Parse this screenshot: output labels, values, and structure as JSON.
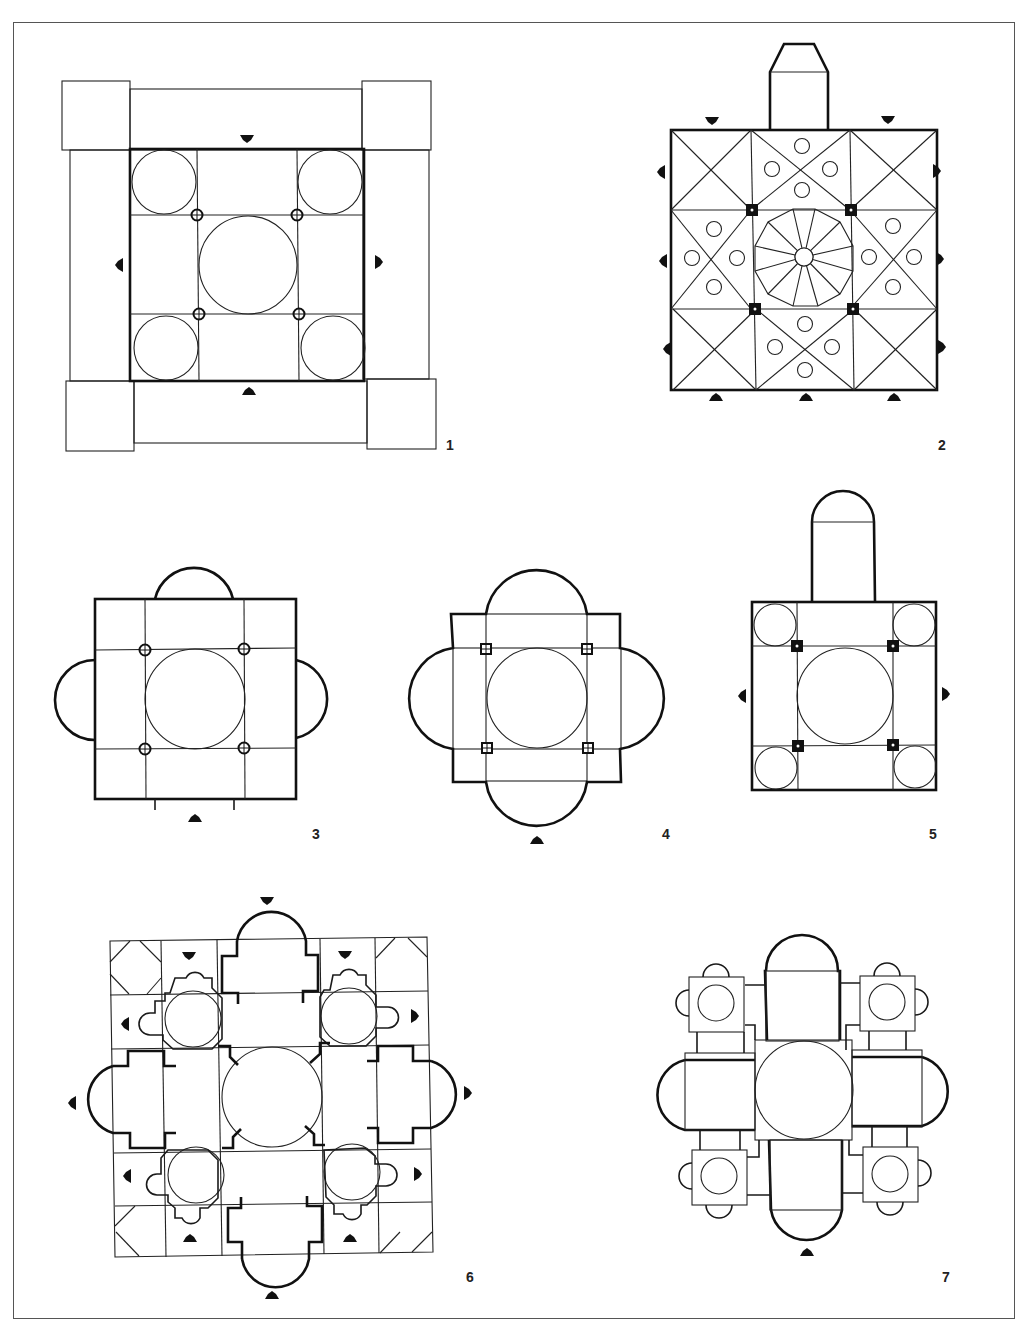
{
  "figure": {
    "type": "architectural floor plans",
    "ink_color": "#111111",
    "background": "#ffffff",
    "plans": [
      {
        "id": "1",
        "label": "1",
        "description": "Square plan with central dome, four corner domes, four piers, surrounding porticoes with corner towers; entrances on four sides"
      },
      {
        "id": "2",
        "label": "2",
        "description": "Square nine-bay plan with cross-vaulted bays, central dodecagonal ribbed dome, polygonal apse at top, four square piers, multiple entrances"
      },
      {
        "id": "3",
        "label": "3",
        "description": "Square plan with central dome, four round piers, semicircular apses on three sides, entrance at bottom"
      },
      {
        "id": "4",
        "label": "4",
        "description": "Quatrefoil / tetraconch plan with central dome, four square piers, four large semicircular apses, entrance at bottom"
      },
      {
        "id": "5",
        "label": "5",
        "description": "Square plan with central dome, four corner domes, four square piers, long apsidal choir at top, side entrances"
      },
      {
        "id": "6",
        "label": "6",
        "description": "Complex centralized plan with large central dome, four corner domed chapels with small apses, four apsidal arms, gridded outer square"
      },
      {
        "id": "7",
        "label": "7",
        "description": "Centralized plan with central dome, four apsidal arms, four corner domed towers with lobed apses, entrance at bottom"
      }
    ]
  }
}
